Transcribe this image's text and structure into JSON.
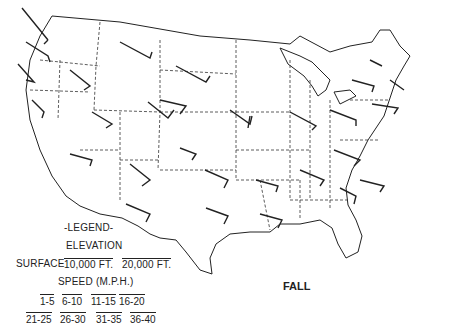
{
  "map": {
    "title": "Fall",
    "season_label": "FALL",
    "colors": {
      "line": "#222222",
      "background": "#ffffff"
    },
    "legend": {
      "title": "-LEGEND-",
      "elevation_label": "ELEVATION",
      "elevations": [
        "SURFACE",
        "10,000 FT.",
        "20,000 FT."
      ],
      "speed_label": "SPEED (M.P.H.)",
      "speed_classes": [
        "1-5",
        "6-10",
        "11-15",
        "16-20",
        "21-25",
        "26-30",
        "31-35",
        "36-40"
      ]
    },
    "station_labels_note": "station abbreviations too small to read"
  }
}
